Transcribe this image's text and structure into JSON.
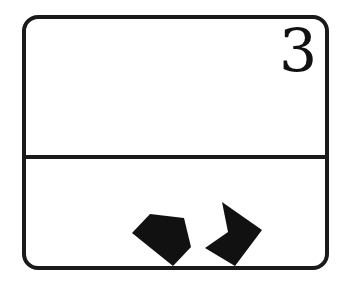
{
  "card": {
    "number": "3",
    "colors": {
      "ink": "#111111",
      "background": "#ffffff"
    },
    "bottom_panel": {
      "shapes": [
        {
          "name": "pentagon",
          "fill": "#111111",
          "points": "150,214 184,218 191,247 173,266 132,233"
        },
        {
          "name": "notched-quad",
          "fill": "#111111",
          "points": "222,202 262,230 235,266 205,248 228,232"
        }
      ]
    }
  }
}
